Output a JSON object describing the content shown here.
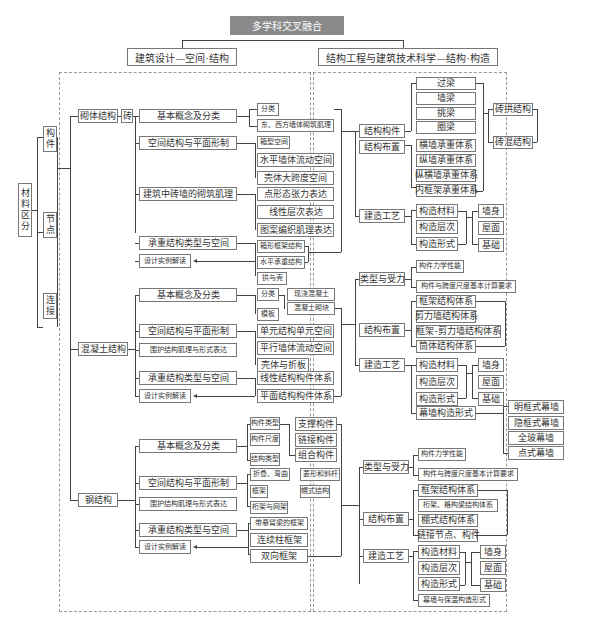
{
  "title": "多学科交叉融合",
  "left_header": "建筑设计—空间·结构",
  "right_header": "结构工程与建筑技术科学—结构·构造",
  "material": {
    "label": "材料区分",
    "chars": [
      "材",
      "料",
      "区",
      "分"
    ],
    "items": [
      [
        "构",
        "件"
      ],
      [
        "节",
        "点"
      ],
      [
        "连",
        "接"
      ]
    ]
  },
  "masonry": {
    "label": "砌体结构",
    "sub": "砖",
    "branches": [
      "基本概念及分类",
      "空间结构与平面形制",
      "建筑中砖墙的砌筑肌理",
      "承重结构类型与空间",
      "设计实例解读"
    ],
    "basic": [
      "分类",
      "东、西方墙体砌筑肌理"
    ],
    "space": [
      "箱型空间",
      "水平墙体流动空间",
      "壳体大跨度空间"
    ],
    "texture": [
      "点形态张力表达",
      "线性层次表达",
      "图案编织肌理表达"
    ],
    "bearing": [
      "箱形框架结构",
      "水平承重结构",
      "拱与壳"
    ]
  },
  "concrete": {
    "label": "混凝土结构",
    "branches": [
      "基本概念及分类",
      "空间结构与平面形制",
      "围护结构肌理与形式表达",
      "承重结构类型与空间",
      "设计实例解读"
    ],
    "basic": [
      "分类",
      "模板"
    ],
    "basic_types": [
      "现浇混凝土",
      "混凝土砌块"
    ],
    "space": [
      "单元结构单元空间",
      "平行墙体流动空间",
      "壳体与折板"
    ],
    "bearing": [
      "线性结构构件体系",
      "平面结构构件体系"
    ]
  },
  "steel": {
    "label": "钢结构",
    "branches": [
      "基本概念及分类",
      "空间结构与平面形制",
      "围护结构肌理与形式表达",
      "承重结构类型与空间",
      "设计实例解读"
    ],
    "basic": [
      "构件类型",
      "构件尺度",
      "结构类型"
    ],
    "members": [
      "支撑构件",
      "链接构件",
      "组合构件"
    ],
    "space": [
      "折叠、弯曲",
      "框架",
      "桁架与网架"
    ],
    "space_extra": [
      "菱形和斜杆",
      "幌式结构"
    ],
    "bearing": [
      "带悬臂梁的框架",
      "连续柱框架",
      "双向框架"
    ]
  },
  "right_masonry": {
    "members_label": "结构构件",
    "members": [
      "过梁",
      "墙梁",
      "挑梁",
      "圈梁"
    ],
    "layout_label": "结构布置",
    "layout": [
      "横墙承重体系",
      "纵墙承重体系",
      "纵横墙承重体系",
      "内框架承重体系"
    ],
    "types": [
      "砖拱结构",
      "砖混结构"
    ],
    "craft_label": "建造工艺",
    "craft": [
      "构造材料",
      "构造层次",
      "构造形式"
    ],
    "parts": [
      "墙身",
      "屋面",
      "基础"
    ]
  },
  "right_concrete": {
    "force_label": "类型与受力",
    "force": [
      "构件力学性能",
      "构件与跨度尺度基本计算要求"
    ],
    "layout_label": "结构布置",
    "layout": [
      "框架结构体系",
      "剪力墙结构体系",
      "框架-剪力墙结构体系",
      "筒体结构体系"
    ],
    "craft_label": "建造工艺",
    "craft": [
      "构造材料",
      "构造层次",
      "构造形式",
      "幕墙构造形式"
    ],
    "parts": [
      "墙身",
      "屋面",
      "基础"
    ],
    "curtain": [
      "明框式幕墙",
      "隐框式幕墙",
      "全玻幕墙",
      "点式幕墙"
    ]
  },
  "right_steel": {
    "force_label": "类型与受力",
    "force": [
      "构件力学性能",
      "构件与跨度尺度基本计算要求"
    ],
    "layout_label": "结构布置",
    "layout": [
      "框架结构体系",
      "桁架、格构梁结构体系",
      "棚式结构体系",
      "链接节点、构件"
    ],
    "craft_label": "建造工艺",
    "craft": [
      "构造材料",
      "构造层次",
      "构造形式",
      "幕墙与保温构造形式"
    ],
    "parts": [
      "墙身",
      "屋面",
      "基础"
    ]
  }
}
